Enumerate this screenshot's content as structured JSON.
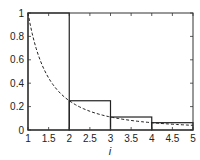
{
  "chart_data": {
    "type": "line",
    "title": "",
    "xlabel": "i",
    "ylabel": "",
    "xlim": [
      1,
      5
    ],
    "ylim": [
      0,
      1
    ],
    "grid": false,
    "legend": null,
    "xticks": [
      1,
      1.5,
      2,
      2.5,
      3,
      3.5,
      4,
      4.5,
      5
    ],
    "xtick_labels": [
      "1",
      "1.5",
      "2",
      "2.5",
      "3",
      "3.5",
      "4",
      "4.5",
      "5"
    ],
    "yticks": [
      0,
      0.2,
      0.4,
      0.6,
      0.8,
      1
    ],
    "ytick_labels": [
      "0",
      "0.2",
      "0.4",
      "0.6",
      "0.8",
      "1"
    ],
    "series": [
      {
        "name": "step bars (1/i^2)",
        "style": "solid-step",
        "bars": [
          {
            "x0": 1,
            "x1": 2,
            "height": 1.0
          },
          {
            "x0": 2,
            "x1": 3,
            "height": 0.25
          },
          {
            "x0": 3,
            "x1": 4,
            "height": 0.111
          },
          {
            "x0": 4,
            "x1": 5,
            "height": 0.0625
          }
        ]
      },
      {
        "name": "curve 1/x^2",
        "style": "dashed",
        "x": [
          1,
          1.25,
          1.5,
          1.75,
          2,
          2.5,
          3,
          3.5,
          4,
          4.5,
          5
        ],
        "y": [
          1.0,
          0.64,
          0.444,
          0.327,
          0.25,
          0.16,
          0.111,
          0.082,
          0.0625,
          0.049,
          0.04
        ]
      }
    ],
    "colors": {
      "axis": "#333333",
      "bars": "#222222",
      "curve": "#222222"
    }
  }
}
